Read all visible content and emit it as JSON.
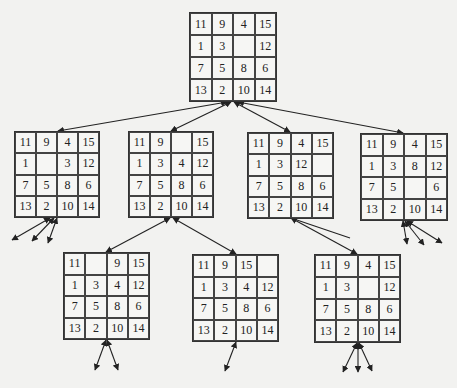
{
  "diagram": {
    "title": "",
    "type": "15-puzzle state-space search tree",
    "boards": [
      {
        "id": "root",
        "level": 0,
        "cells": [
          [
            "11",
            "9",
            "4",
            "15"
          ],
          [
            "1",
            "3",
            "",
            "12"
          ],
          [
            "7",
            "5",
            "8",
            "6"
          ],
          [
            "13",
            "2",
            "10",
            "14"
          ]
        ]
      },
      {
        "id": "l1-a",
        "level": 1,
        "cells": [
          [
            "11",
            "9",
            "4",
            "15"
          ],
          [
            "1",
            "",
            "3",
            "12"
          ],
          [
            "7",
            "5",
            "8",
            "6"
          ],
          [
            "13",
            "2",
            "10",
            "14"
          ]
        ]
      },
      {
        "id": "l1-b",
        "level": 1,
        "cells": [
          [
            "11",
            "9",
            "",
            "15"
          ],
          [
            "1",
            "3",
            "4",
            "12"
          ],
          [
            "7",
            "5",
            "8",
            "6"
          ],
          [
            "13",
            "2",
            "10",
            "14"
          ]
        ]
      },
      {
        "id": "l1-c",
        "level": 1,
        "cells": [
          [
            "11",
            "9",
            "4",
            "15"
          ],
          [
            "1",
            "3",
            "12",
            ""
          ],
          [
            "7",
            "5",
            "8",
            "6"
          ],
          [
            "13",
            "2",
            "10",
            "14"
          ]
        ]
      },
      {
        "id": "l1-d",
        "level": 1,
        "cells": [
          [
            "11",
            "9",
            "4",
            "15"
          ],
          [
            "1",
            "3",
            "8",
            "12"
          ],
          [
            "7",
            "5",
            "",
            "6"
          ],
          [
            "13",
            "2",
            "10",
            "14"
          ]
        ]
      },
      {
        "id": "l2-a",
        "level": 2,
        "cells": [
          [
            "11",
            "",
            "9",
            "15"
          ],
          [
            "1",
            "3",
            "4",
            "12"
          ],
          [
            "7",
            "5",
            "8",
            "6"
          ],
          [
            "13",
            "2",
            "10",
            "14"
          ]
        ]
      },
      {
        "id": "l2-b",
        "level": 2,
        "cells": [
          [
            "11",
            "9",
            "15",
            ""
          ],
          [
            "1",
            "3",
            "4",
            "12"
          ],
          [
            "7",
            "5",
            "8",
            "6"
          ],
          [
            "13",
            "2",
            "10",
            "14"
          ]
        ]
      },
      {
        "id": "l2-c",
        "level": 2,
        "cells": [
          [
            "11",
            "9",
            "4",
            "15"
          ],
          [
            "1",
            "3",
            "",
            "12"
          ],
          [
            "7",
            "5",
            "8",
            "6"
          ],
          [
            "13",
            "2",
            "10",
            "14"
          ]
        ]
      }
    ]
  }
}
